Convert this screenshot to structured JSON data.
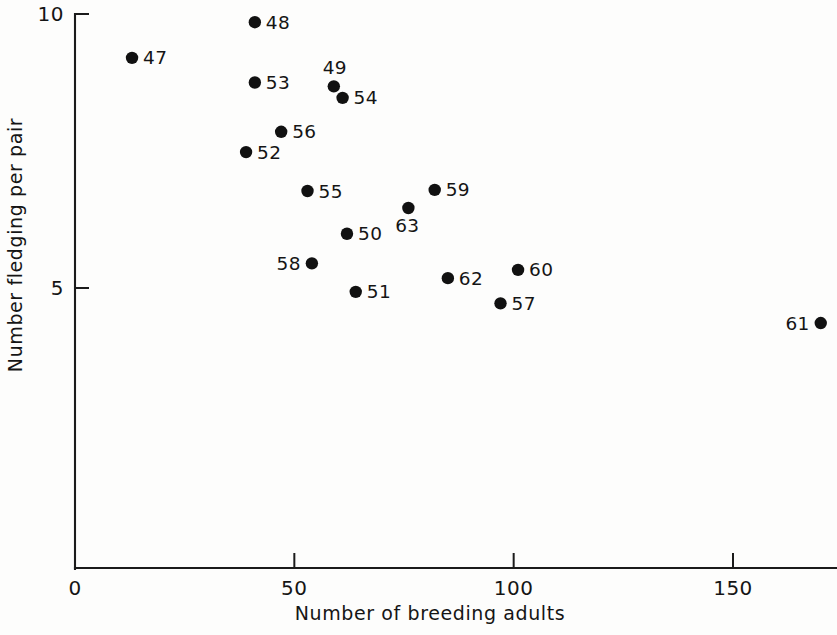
{
  "chart_data": {
    "type": "scatter",
    "title": "",
    "xlabel": "Number of breeding adults",
    "ylabel": "Number fledging per pair",
    "xlim": [
      0,
      173
    ],
    "ylim": [
      3.05,
      10.1
    ],
    "grid": false,
    "legend": "none",
    "x_ticks": [
      {
        "value": 0,
        "label": "0"
      },
      {
        "value": 50,
        "label": "50"
      },
      {
        "value": 100,
        "label": "100"
      },
      {
        "value": 150,
        "label": "150"
      }
    ],
    "y_ticks": [
      {
        "value": 5,
        "label": "5"
      },
      {
        "value": 10,
        "label": "10"
      }
    ],
    "point_label_note": "Each point is labelled with a two-digit year",
    "points": [
      {
        "label": "47",
        "x": 13,
        "y": 9.2,
        "label_pos": "right"
      },
      {
        "label": "48",
        "x": 41,
        "y": 9.85,
        "label_pos": "right"
      },
      {
        "label": "49",
        "x": 59,
        "y": 8.68,
        "label_pos": "above"
      },
      {
        "label": "50",
        "x": 62,
        "y": 5.99,
        "label_pos": "right"
      },
      {
        "label": "51",
        "x": 64,
        "y": 4.93,
        "label_pos": "right"
      },
      {
        "label": "52",
        "x": 39,
        "y": 7.48,
        "label_pos": "right"
      },
      {
        "label": "53",
        "x": 41,
        "y": 8.75,
        "label_pos": "right"
      },
      {
        "label": "54",
        "x": 61,
        "y": 8.47,
        "label_pos": "right"
      },
      {
        "label": "55",
        "x": 53,
        "y": 6.77,
        "label_pos": "right"
      },
      {
        "label": "56",
        "x": 47,
        "y": 7.85,
        "label_pos": "right"
      },
      {
        "label": "57",
        "x": 97,
        "y": 4.72,
        "label_pos": "right"
      },
      {
        "label": "58",
        "x": 54,
        "y": 5.45,
        "label_pos": "left"
      },
      {
        "label": "59",
        "x": 82,
        "y": 6.79,
        "label_pos": "right"
      },
      {
        "label": "60",
        "x": 101,
        "y": 5.33,
        "label_pos": "right"
      },
      {
        "label": "61",
        "x": 170,
        "y": 4.36,
        "label_pos": "left"
      },
      {
        "label": "62",
        "x": 85,
        "y": 5.18,
        "label_pos": "right"
      },
      {
        "label": "63",
        "x": 76,
        "y": 6.46,
        "label_pos": "below"
      }
    ]
  },
  "axes": {
    "x_title": "Number of breeding adults",
    "y_title": "Number fledging per pair"
  }
}
